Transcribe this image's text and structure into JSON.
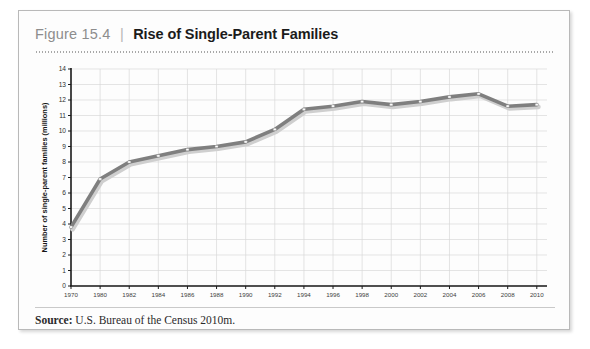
{
  "figure": {
    "number_label": "Figure 15.4",
    "divider": "|",
    "title": "Rise of Single-Parent Families",
    "source_label": "Source:",
    "source_text": "U.S. Bureau of the Census 2010m."
  },
  "colors": {
    "line": "#7f7f7f",
    "line_shadow": "#cfcfcf",
    "marker_fill": "#ffffff",
    "marker_stroke": "#9a9a9a",
    "grid": "#d9d9d9",
    "axis": "#1a1a1a",
    "card_border": "#b9b9b9",
    "figure_number": "#8d8d8d",
    "title_text": "#1b1b1b"
  },
  "chart_data": {
    "type": "line",
    "title": "Rise of Single-Parent Families",
    "xlabel": "",
    "ylabel": "Number of single-parent families (millions)",
    "ylim": [
      0,
      14
    ],
    "ytick_labels": [
      "0",
      "1",
      "2",
      "3",
      "4",
      "5",
      "6",
      "7",
      "8",
      "9",
      "10",
      "11",
      "12",
      "13",
      "14"
    ],
    "yticks": [
      0,
      1,
      2,
      3,
      4,
      5,
      6,
      7,
      8,
      9,
      10,
      11,
      12,
      13,
      14
    ],
    "grid": true,
    "legend": "none",
    "categories": [
      "1970",
      "1980",
      "1982",
      "1984",
      "1986",
      "1988",
      "1990",
      "1992",
      "1994",
      "1996",
      "1998",
      "2000",
      "2002",
      "2004",
      "2006",
      "2008",
      "2010"
    ],
    "values": [
      3.8,
      6.9,
      8.0,
      8.4,
      8.8,
      9.0,
      9.3,
      10.1,
      11.4,
      11.6,
      11.9,
      11.7,
      11.9,
      12.2,
      12.4,
      11.6,
      11.7
    ],
    "series": [
      {
        "name": "Single-parent families",
        "values": [
          3.8,
          6.9,
          8.0,
          8.4,
          8.8,
          9.0,
          9.3,
          10.1,
          11.4,
          11.6,
          11.9,
          11.7,
          11.9,
          12.2,
          12.4,
          11.6,
          11.7
        ]
      }
    ]
  }
}
